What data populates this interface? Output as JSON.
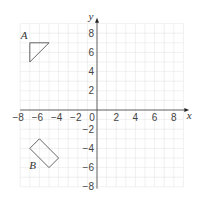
{
  "diagram": {
    "type": "coordinate-grid",
    "origin_px": {
      "x": 97,
      "y": 110
    },
    "unit_px": 9.6,
    "x_range": [
      -8,
      9
    ],
    "y_range": [
      -8,
      9
    ],
    "grid": {
      "min": -8,
      "max": 10,
      "color": "#e6e6e6"
    },
    "axes": {
      "x_label": "x",
      "y_label": "y",
      "color": "#555555",
      "x_ticks": [
        {
          "value": -8,
          "label": "−8"
        },
        {
          "value": -6,
          "label": "−6"
        },
        {
          "value": -4,
          "label": "−4"
        },
        {
          "value": -2,
          "label": "−2"
        },
        {
          "value": 0,
          "label": "0"
        },
        {
          "value": 2,
          "label": "2"
        },
        {
          "value": 4,
          "label": "4"
        },
        {
          "value": 6,
          "label": "6"
        },
        {
          "value": 8,
          "label": "8"
        }
      ],
      "y_ticks": [
        {
          "value": 8,
          "label": "8"
        },
        {
          "value": 6,
          "label": "6"
        },
        {
          "value": 4,
          "label": "4"
        },
        {
          "value": 2,
          "label": "2"
        },
        {
          "value": -2,
          "label": "−2"
        },
        {
          "value": -4,
          "label": "−4"
        },
        {
          "value": -6,
          "label": "−6"
        },
        {
          "value": -8,
          "label": "−8"
        }
      ]
    },
    "shapes": [
      {
        "name": "A",
        "kind": "triangle",
        "vertices": [
          [
            -7,
            7
          ],
          [
            -5,
            7
          ],
          [
            -7,
            5
          ]
        ],
        "label_pos": [
          -7.6,
          7.4
        ]
      },
      {
        "name": "B",
        "kind": "rectangle",
        "vertices": [
          [
            -6,
            -3
          ],
          [
            -4,
            -5
          ],
          [
            -5,
            -6
          ],
          [
            -7,
            -4
          ]
        ],
        "label_pos": [
          -6.7,
          -6.1
        ]
      }
    ],
    "stroke_color": "#555555"
  }
}
